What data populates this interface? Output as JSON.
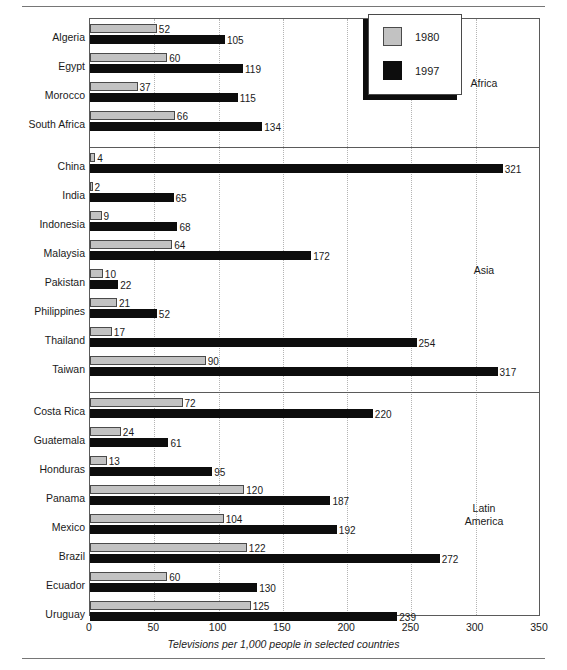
{
  "chart_data": {
    "type": "bar",
    "orientation": "horizontal",
    "title": "",
    "xlabel": "Televisions per 1,000 people in selected countries",
    "ylabel": "",
    "xlim": [
      0,
      350
    ],
    "xticks": [
      0,
      50,
      100,
      150,
      200,
      250,
      300,
      350
    ],
    "grid": "vertical-dotted",
    "legend": {
      "position": "top-right",
      "entries": [
        {
          "name": "1980",
          "color": "#c2c2c2"
        },
        {
          "name": "1997",
          "color": "#0d0d0d"
        }
      ]
    },
    "series": [
      {
        "name": "1980",
        "color": "#c2c2c2"
      },
      {
        "name": "1997",
        "color": "#0d0d0d"
      }
    ],
    "sections": [
      {
        "region": "Africa",
        "countries": [
          {
            "label": "Algeria",
            "values": [
              52,
              105
            ]
          },
          {
            "label": "Egypt",
            "values": [
              60,
              119
            ]
          },
          {
            "label": "Morocco",
            "values": [
              37,
              115
            ]
          },
          {
            "label": "South  Africa",
            "values": [
              66,
              134
            ]
          }
        ]
      },
      {
        "region": "Asia",
        "countries": [
          {
            "label": "China",
            "values": [
              4,
              321
            ]
          },
          {
            "label": "India",
            "values": [
              2,
              65
            ]
          },
          {
            "label": "Indonesia",
            "values": [
              9,
              68
            ]
          },
          {
            "label": "Malaysia",
            "values": [
              64,
              172
            ]
          },
          {
            "label": "Pakistan",
            "values": [
              10,
              22
            ]
          },
          {
            "label": "Philippines",
            "values": [
              21,
              52
            ]
          },
          {
            "label": "Thailand",
            "values": [
              17,
              254
            ]
          },
          {
            "label": "Taiwan",
            "values": [
              90,
              317
            ]
          }
        ]
      },
      {
        "region": "Latin\nAmerica",
        "countries": [
          {
            "label": "Costa Rica",
            "values": [
              72,
              220
            ]
          },
          {
            "label": "Guatemala",
            "values": [
              24,
              61
            ]
          },
          {
            "label": "Honduras",
            "values": [
              13,
              95
            ]
          },
          {
            "label": "Panama",
            "values": [
              120,
              187
            ]
          },
          {
            "label": "Mexico",
            "values": [
              104,
              192
            ]
          },
          {
            "label": "Brazil",
            "values": [
              122,
              272
            ]
          },
          {
            "label": "Ecuador",
            "values": [
              60,
              130
            ]
          },
          {
            "label": "Uruguay",
            "values": [
              125,
              239
            ]
          }
        ]
      }
    ]
  }
}
